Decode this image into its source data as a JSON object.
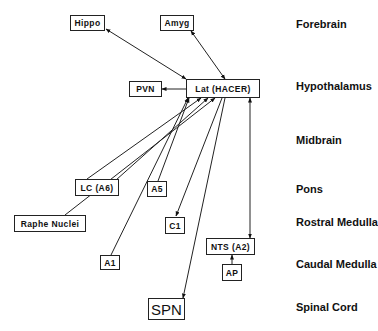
{
  "diagram": {
    "type": "neural-connectivity-diagram",
    "regions": [
      {
        "id": "forebrain",
        "label": "Forebrain"
      },
      {
        "id": "hypothalamus",
        "label": "Hypothalamus"
      },
      {
        "id": "midbrain",
        "label": "Midbrain"
      },
      {
        "id": "pons",
        "label": "Pons"
      },
      {
        "id": "rostral_medulla",
        "label": "Rostral Medulla"
      },
      {
        "id": "caudal_medulla",
        "label": "Caudal Medulla"
      },
      {
        "id": "spinal_cord",
        "label": "Spinal Cord"
      }
    ],
    "nodes": {
      "hippo": {
        "label": "Hippo",
        "region": "Forebrain"
      },
      "amyg": {
        "label": "Amyg",
        "region": "Forebrain"
      },
      "pvn": {
        "label": "PVN",
        "region": "Hypothalamus"
      },
      "lat": {
        "label": "Lat (HACER)",
        "region": "Hypothalamus"
      },
      "lc": {
        "label": "LC (A6)",
        "region": "Pons"
      },
      "a5": {
        "label": "A5",
        "region": "Pons"
      },
      "raphe": {
        "label": "Raphe Nuclei",
        "region": "Pons"
      },
      "c1": {
        "label": "C1",
        "region": "Rostral Medulla"
      },
      "a1": {
        "label": "A1",
        "region": "Caudal Medulla"
      },
      "nts": {
        "label": "NTS (A2)",
        "region": "Caudal Medulla"
      },
      "ap": {
        "label": "AP",
        "region": "Caudal Medulla"
      },
      "spn": {
        "label": "SPN",
        "region": "Spinal Cord"
      }
    },
    "edges": [
      {
        "from": "Hippo",
        "to": "Lat (HACER)",
        "direction": "bidirectional"
      },
      {
        "from": "Amyg",
        "to": "Lat (HACER)",
        "direction": "bidirectional"
      },
      {
        "from": "Lat (HACER)",
        "to": "PVN",
        "direction": "forward"
      },
      {
        "from": "LC (A6)",
        "to": "Lat (HACER)",
        "direction": "forward"
      },
      {
        "from": "Raphe Nuclei",
        "to": "Lat (HACER)",
        "direction": "forward"
      },
      {
        "from": "A5",
        "to": "Lat (HACER)",
        "direction": "forward"
      },
      {
        "from": "A1",
        "to": "Lat (HACER)",
        "direction": "forward"
      },
      {
        "from": "Lat (HACER)",
        "to": "C1",
        "direction": "forward"
      },
      {
        "from": "Lat (HACER)",
        "to": "SPN",
        "direction": "forward"
      },
      {
        "from": "NTS (A2)",
        "to": "Lat (HACER)",
        "direction": "bidirectional"
      },
      {
        "from": "AP",
        "to": "NTS (A2)",
        "direction": "forward"
      }
    ]
  }
}
